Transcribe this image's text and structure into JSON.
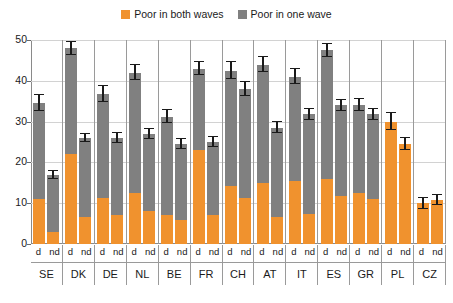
{
  "legend": {
    "position": "top-center",
    "entries": [
      {
        "label": "Poor in both waves",
        "color": "#F0922E",
        "swatch": "square-swatch"
      },
      {
        "label": "Poor in one wave",
        "color": "#808080",
        "swatch": "square-swatch"
      }
    ]
  },
  "axis": {
    "y_ticks": [
      0,
      10,
      20,
      30,
      40,
      50
    ],
    "ylim": [
      0,
      50
    ],
    "grid": true
  },
  "sub_labels": [
    "d",
    "nd"
  ],
  "chart_data": {
    "type": "bar",
    "title": "",
    "xlabel": "",
    "ylabel": "",
    "ylim": [
      0,
      50
    ],
    "grid": true,
    "legend_position": "top-center",
    "stacked": true,
    "categories": [
      "SE",
      "DK",
      "DE",
      "NL",
      "BE",
      "FR",
      "CH",
      "AT",
      "IT",
      "ES",
      "GR",
      "PL",
      "CZ"
    ],
    "subgroups": [
      "d",
      "nd"
    ],
    "series": [
      {
        "name": "Poor in both waves",
        "color": "#F0922E",
        "values": {
          "d": [
            11.0,
            22.0,
            11.2,
            12.5,
            7.2,
            23.0,
            14.3,
            15.0,
            15.4,
            16.0,
            12.5,
            30.0,
            10.0
          ],
          "nd": [
            3.0,
            6.5,
            7.0,
            8.0,
            5.8,
            7.0,
            11.2,
            6.5,
            7.4,
            11.8,
            11.0,
            24.5,
            10.8
          ]
        }
      },
      {
        "name": "Poor in one wave",
        "color": "#808080",
        "values": {
          "d": [
            23.5,
            26.0,
            25.5,
            29.5,
            24.0,
            20.0,
            28.2,
            29.0,
            25.6,
            31.5,
            21.5,
            0.0,
            0.0
          ],
          "nd": [
            14.0,
            19.5,
            19.0,
            19.0,
            18.8,
            18.0,
            26.8,
            22.0,
            24.4,
            22.2,
            20.8,
            0.0,
            0.0
          ]
        }
      }
    ],
    "totals": {
      "d": [
        34.5,
        48.0,
        36.7,
        42.0,
        31.2,
        43.0,
        42.5,
        44.0,
        41.0,
        47.5,
        34.0,
        30.0,
        10.0
      ],
      "nd": [
        17.0,
        26.0,
        26.0,
        27.0,
        24.6,
        25.0,
        38.4,
        28.5,
        31.8,
        34.0,
        31.8,
        24.5,
        10.8
      ]
    },
    "error_bars": {
      "d": [
        2.0,
        1.6,
        2.0,
        1.8,
        1.6,
        1.6,
        2.0,
        1.8,
        1.8,
        1.6,
        1.5,
        2.0,
        1.4
      ],
      "nd": [
        1.0,
        1.0,
        1.2,
        1.2,
        1.2,
        1.2,
        1.6,
        1.4,
        1.4,
        1.4,
        1.3,
        1.4,
        1.3
      ]
    }
  }
}
